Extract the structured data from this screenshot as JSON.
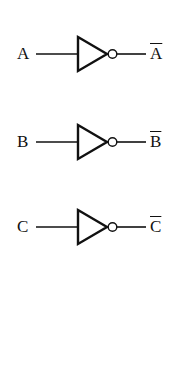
{
  "diagram": {
    "type": "logic-gates",
    "gates": [
      {
        "type": "NOT",
        "input": "A",
        "output": "A",
        "output_overline": true
      },
      {
        "type": "NOT",
        "input": "B",
        "output": "B",
        "output_overline": true
      },
      {
        "type": "NOT",
        "input": "C",
        "output": "C",
        "output_overline": true
      }
    ]
  },
  "colors": {
    "stroke": "#111111",
    "background": "#ffffff"
  }
}
